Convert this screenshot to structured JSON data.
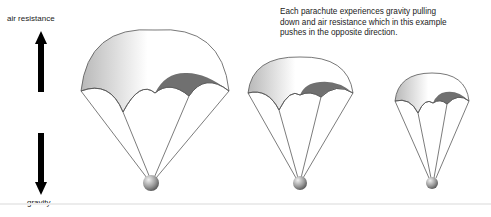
{
  "forces": {
    "up_label": "air resistance",
    "down_label": "gravity"
  },
  "caption": {
    "lines": [
      "Each parachute experiences gravity pulling",
      "down and air resistance which in this example",
      "pushes in the opposite direction."
    ]
  },
  "parachutes": [
    {
      "name": "large",
      "cx": 155,
      "top": 30,
      "half_width": 74,
      "canopy_bottom": 92,
      "load_y": 182,
      "load_r": 8
    },
    {
      "name": "medium",
      "cx": 300,
      "top": 82,
      "half_width": 51,
      "canopy_bottom": 111,
      "load_y": 183,
      "load_r": 7
    },
    {
      "name": "small",
      "cx": 432,
      "top": 100,
      "half_width": 37,
      "canopy_bottom": 122,
      "load_y": 183,
      "load_r": 6
    }
  ],
  "colors": {
    "canopy_light": "#ffffff",
    "canopy_mid": "#bdbdbd",
    "canopy_dark": "#707070",
    "outline": "#555555",
    "arrow": "#000000"
  }
}
